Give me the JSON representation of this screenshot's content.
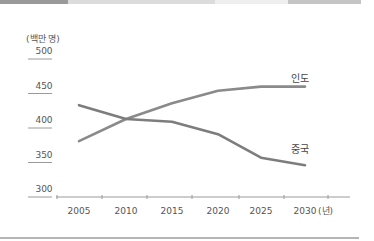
{
  "header_bar": {
    "segments": [
      {
        "x": 0,
        "w": 68,
        "color": "#9a9a9a"
      },
      {
        "x": 68,
        "w": 147,
        "color": "#dcdcdc"
      },
      {
        "x": 215,
        "w": 73,
        "color": "#eeeeee"
      },
      {
        "x": 288,
        "w": 73,
        "color": "#c4c4c4"
      }
    ]
  },
  "chart_data": {
    "type": "line",
    "title": "",
    "ylabel": "(백만 명)",
    "xlabel": "(년)",
    "ylim": [
      300,
      500
    ],
    "yticks": [
      "500",
      "450",
      "400",
      "350",
      "300"
    ],
    "x": [
      "2005",
      "2010",
      "2015",
      "2020",
      "2025",
      "2030"
    ],
    "series": [
      {
        "name": "인도",
        "values": [
          381,
          413,
          436,
          454,
          460,
          460
        ],
        "color": "#8a8a8a"
      },
      {
        "name": "중국",
        "values": [
          433,
          413,
          409,
          391,
          357,
          346
        ],
        "color": "#7d7d7d"
      }
    ],
    "grid": false,
    "legend": "inline-labels"
  },
  "colors": {
    "axis": "#9a9a9a",
    "text": "#555555",
    "line": "#858585"
  }
}
